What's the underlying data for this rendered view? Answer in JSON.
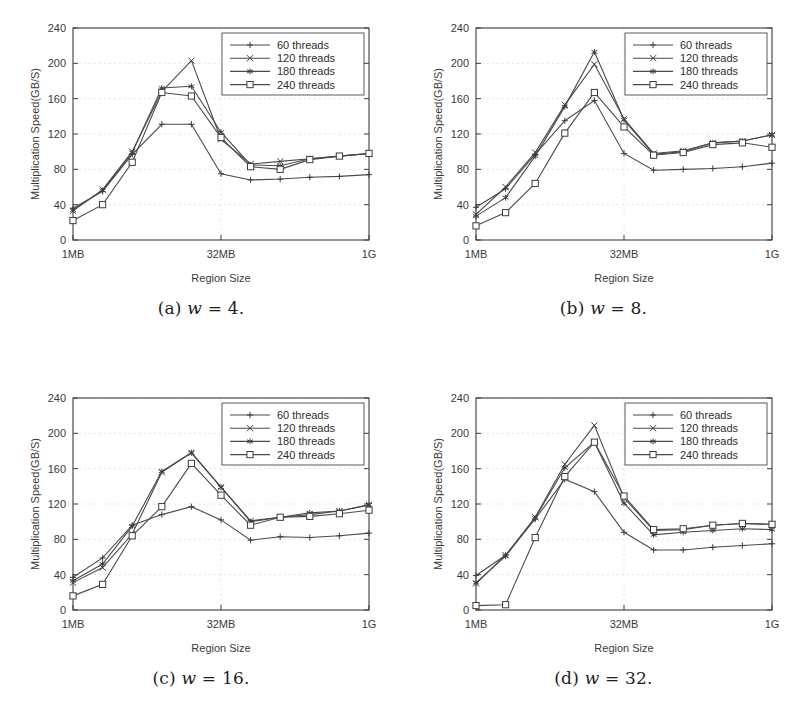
{
  "figure": {
    "axis": {
      "ylabel": "Multiplication Speed(GB/S)",
      "xlabel": "Region Size",
      "yticks": [
        "0",
        "40",
        "80",
        "120",
        "160",
        "200",
        "240"
      ],
      "ytick_values": [
        0,
        40,
        80,
        120,
        160,
        200,
        240
      ],
      "xticks": [
        "1MB",
        "32MB",
        "1G"
      ],
      "ylim": [
        0,
        240
      ],
      "grid": true,
      "legend_position": "top-right"
    },
    "series_names": [
      "60 threads",
      "120 threads",
      "180 threads",
      "240 threads"
    ],
    "markers": [
      "plus",
      "cross",
      "star",
      "square"
    ],
    "captions": {
      "a": {
        "tag": "(a)",
        "var": "w",
        "eq": "=",
        "value": "4."
      },
      "b": {
        "tag": "(b)",
        "var": "w",
        "eq": "=",
        "value": "8."
      },
      "c": {
        "tag": "(c)",
        "var": "w",
        "eq": "=",
        "value": "16."
      },
      "d": {
        "tag": "(d)",
        "var": "w",
        "eq": "=",
        "value": "32."
      }
    }
  },
  "chart_data": [
    {
      "id": "a",
      "type": "line",
      "title": "(a) w = 4.",
      "xlabel": "Region Size",
      "ylabel": "Multiplication Speed(GB/S)",
      "ylim": [
        0,
        240
      ],
      "xtick_labels": [
        "1MB",
        "32MB",
        "1G"
      ],
      "xtick_indices": [
        0,
        5,
        10
      ],
      "x": [
        0,
        1,
        2,
        3,
        4,
        5,
        6,
        7,
        8,
        9,
        10
      ],
      "grid": true,
      "legend_position": "top-right",
      "series": [
        {
          "name": "60 threads",
          "marker": "plus",
          "values": [
            36,
            55,
            97,
            131,
            131,
            75,
            68,
            69,
            71,
            72,
            74
          ]
        },
        {
          "name": "120 threads",
          "marker": "cross",
          "values": [
            33,
            57,
            100,
            168,
            203,
            114,
            86,
            89,
            92,
            95,
            98
          ]
        },
        {
          "name": "180 threads",
          "marker": "star",
          "values": [
            34,
            56,
            99,
            172,
            174,
            122,
            85,
            84,
            92,
            95,
            98
          ]
        },
        {
          "name": "240 threads",
          "marker": "square",
          "values": [
            22,
            40,
            88,
            167,
            163,
            116,
            83,
            80,
            91,
            95,
            98
          ]
        }
      ]
    },
    {
      "id": "b",
      "type": "line",
      "title": "(b) w = 8.",
      "xlabel": "Region Size",
      "ylabel": "Multiplication Speed(GB/S)",
      "ylim": [
        0,
        240
      ],
      "xtick_labels": [
        "1MB",
        "32MB",
        "1G"
      ],
      "xtick_indices": [
        0,
        5,
        10
      ],
      "x": [
        0,
        1,
        2,
        3,
        4,
        5,
        6,
        7,
        8,
        9,
        10
      ],
      "grid": true,
      "legend_position": "top-right",
      "series": [
        {
          "name": "60 threads",
          "marker": "plus",
          "values": [
            37,
            58,
            97,
            135,
            158,
            98,
            79,
            80,
            81,
            83,
            87
          ]
        },
        {
          "name": "120 threads",
          "marker": "cross",
          "values": [
            29,
            60,
            99,
            153,
            199,
            137,
            98,
            101,
            110,
            112,
            119
          ]
        },
        {
          "name": "180 threads",
          "marker": "star",
          "values": [
            27,
            48,
            95,
            151,
            213,
            136,
            97,
            100,
            110,
            112,
            119
          ]
        },
        {
          "name": "240 threads",
          "marker": "square",
          "values": [
            16,
            31,
            64,
            121,
            167,
            128,
            96,
            99,
            108,
            110,
            105
          ]
        }
      ]
    },
    {
      "id": "c",
      "type": "line",
      "title": "(c) w = 16.",
      "xlabel": "Region Size",
      "ylabel": "Multiplication Speed(GB/S)",
      "ylim": [
        0,
        240
      ],
      "xtick_labels": [
        "1MB",
        "32MB",
        "1G"
      ],
      "xtick_indices": [
        0,
        5,
        10
      ],
      "x": [
        0,
        1,
        2,
        3,
        4,
        5,
        6,
        7,
        8,
        9,
        10
      ],
      "grid": true,
      "legend_position": "top-right",
      "series": [
        {
          "name": "60 threads",
          "marker": "plus",
          "values": [
            37,
            59,
            96,
            108,
            117,
            102,
            79,
            83,
            82,
            84,
            87
          ]
        },
        {
          "name": "120 threads",
          "marker": "cross",
          "values": [
            31,
            48,
            86,
            156,
            178,
            139,
            101,
            105,
            108,
            112,
            119
          ]
        },
        {
          "name": "180 threads",
          "marker": "star",
          "values": [
            33,
            52,
            95,
            157,
            178,
            139,
            100,
            105,
            110,
            112,
            119
          ]
        },
        {
          "name": "240 threads",
          "marker": "square",
          "values": [
            16,
            29,
            84,
            117,
            166,
            130,
            96,
            105,
            106,
            109,
            113
          ]
        }
      ]
    },
    {
      "id": "d",
      "type": "line",
      "title": "(d) w = 32.",
      "xlabel": "Region Size",
      "ylabel": "Multiplication Speed(GB/S)",
      "ylim": [
        0,
        240
      ],
      "xtick_labels": [
        "1MB",
        "32MB",
        "1G"
      ],
      "xtick_indices": [
        0,
        5,
        10
      ],
      "x": [
        0,
        1,
        2,
        3,
        4,
        5,
        6,
        7,
        8,
        9,
        10
      ],
      "grid": true,
      "legend_position": "top-right",
      "series": [
        {
          "name": "60 threads",
          "marker": "plus",
          "values": [
            39,
            62,
            103,
            148,
            134,
            88,
            68,
            68,
            71,
            73,
            75
          ]
        },
        {
          "name": "120 threads",
          "marker": "cross",
          "values": [
            30,
            62,
            105,
            165,
            209,
            127,
            90,
            91,
            96,
            98,
            97
          ]
        },
        {
          "name": "180 threads",
          "marker": "star",
          "values": [
            31,
            61,
            104,
            161,
            190,
            121,
            85,
            88,
            90,
            92,
            91
          ]
        },
        {
          "name": "240 threads",
          "marker": "square",
          "values": [
            5,
            6,
            82,
            151,
            190,
            129,
            91,
            92,
            96,
            98,
            97
          ]
        }
      ]
    }
  ]
}
